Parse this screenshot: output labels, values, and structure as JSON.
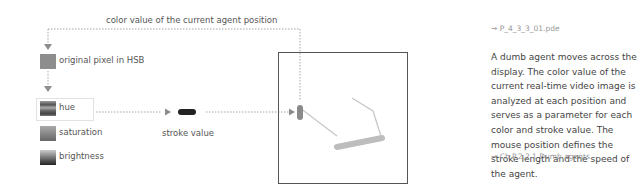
{
  "diagram": {
    "top_label": "color value of the current agent position",
    "nodes": [
      {
        "id": "original",
        "label": "original pixel in HSB"
      },
      {
        "id": "hue",
        "label": "hue"
      },
      {
        "id": "saturation",
        "label": "saturation"
      },
      {
        "id": "brightness",
        "label": "brightness"
      },
      {
        "id": "stroke",
        "label": "stroke value"
      }
    ],
    "colors": {
      "arrow": "#999999",
      "frame": "#555555",
      "agent_head": "#8a8a8a",
      "stroke_sample": "#222222",
      "thick_stroke": "#bdbdbd",
      "thin_stroke": "#c8c8c8"
    }
  },
  "sidebar": {
    "filename": "→ P_4_3_3_01.pde",
    "description": "A dumb agent moves across the display. The color value of the current real-time video image is analyzed at each position and serves as a parameter for each color and stroke value. The mouse position defines the stroke length and the speed of the agent.",
    "reference": "→ Ch.P.2.2.1 Dumb agents"
  }
}
